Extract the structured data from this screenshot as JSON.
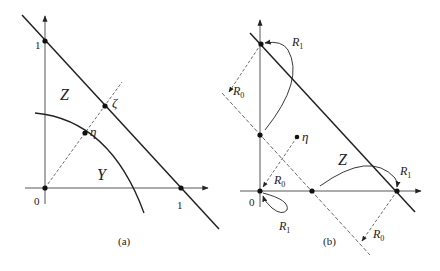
{
  "panel_a": {
    "caption": "(a)",
    "tick_y": "1",
    "tick_x": "1",
    "origin": "0",
    "region_z": "Z",
    "region_y": "Y",
    "point_zeta": "ζ",
    "point_eta": "η"
  },
  "panel_b": {
    "caption": "(b)",
    "origin": "0",
    "region_z": "Z",
    "point_eta": "η",
    "r1_top": "R",
    "r1_top_sub": "1",
    "r0_left": "R",
    "r0_left_sub": "0",
    "r0_mid": "R",
    "r0_mid_sub": "0",
    "r1_origin": "R",
    "r1_origin_sub": "1",
    "r1_right": "R",
    "r1_right_sub": "1",
    "r0_bottom": "R",
    "r0_bottom_sub": "0"
  }
}
